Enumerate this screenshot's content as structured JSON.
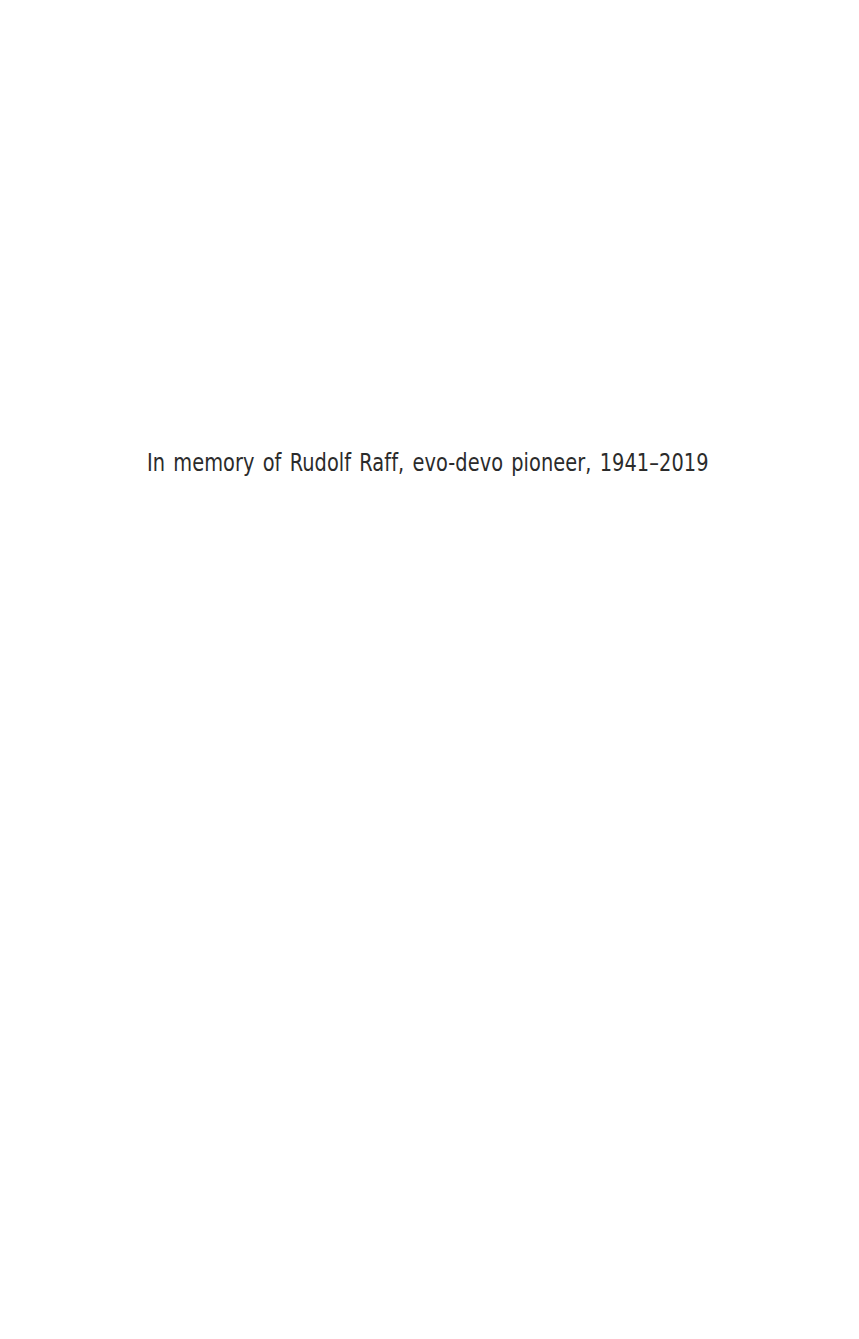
{
  "page": {
    "background_color": "#ffffff",
    "width": 859,
    "height": 1339,
    "type": "dedication-page"
  },
  "dedication": {
    "text": "In memory of Rudolf Raff, evo-devo pioneer, 1941–2019",
    "color": "#2b2b2b"
  }
}
